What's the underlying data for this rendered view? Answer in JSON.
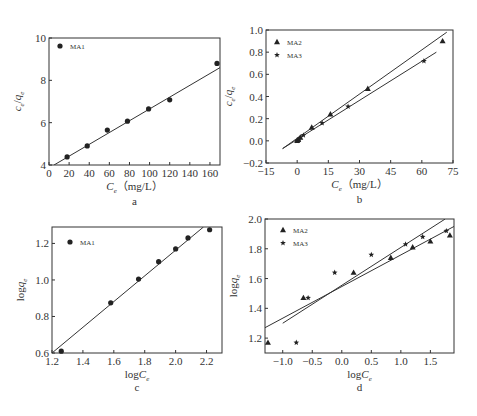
{
  "chart_data": [
    {
      "id": "a",
      "type": "scatter",
      "caption": "a",
      "xlabel": "Ce（mg/L）",
      "ylabel": "ce/qe",
      "xlim": [
        0,
        170
      ],
      "ylim": [
        4,
        10
      ],
      "xticks": [
        0,
        20,
        40,
        60,
        80,
        100,
        120,
        140,
        160
      ],
      "yticks": [
        4,
        6,
        8,
        10
      ],
      "grid": false,
      "legend_position": "upper-left",
      "series": [
        {
          "name": "MA1",
          "marker": "circle",
          "x": [
            18,
            38,
            58,
            78,
            99,
            120,
            167
          ],
          "y": [
            4.38,
            4.9,
            5.65,
            6.07,
            6.65,
            7.08,
            8.8
          ],
          "fit_line": {
            "x": [
              5,
              170
            ],
            "y": [
              4.0,
              8.6
            ]
          }
        }
      ]
    },
    {
      "id": "b",
      "type": "scatter",
      "caption": "b",
      "xlabel": "Ce（mg/L）",
      "ylabel": "ce/qe",
      "xlim": [
        -15,
        75
      ],
      "ylim": [
        -0.2,
        1.0
      ],
      "xticks": [
        -15,
        0,
        15,
        30,
        45,
        60,
        75
      ],
      "yticks": [
        -0.2,
        0.0,
        0.2,
        0.4,
        0.6,
        0.8,
        1.0
      ],
      "grid": false,
      "legend_position": "upper-left",
      "series": [
        {
          "name": "MA2",
          "marker": "triangle",
          "x": [
            0,
            0.5,
            1.5,
            7,
            16,
            34,
            70
          ],
          "y": [
            0.0,
            0.01,
            0.03,
            0.12,
            0.24,
            0.47,
            0.9
          ],
          "fit_line": {
            "x": [
              -7,
              72
            ],
            "y": [
              -0.07,
              0.98
            ]
          }
        },
        {
          "name": "MA3",
          "marker": "star",
          "x": [
            0,
            1,
            3,
            12,
            24.5,
            61
          ],
          "y": [
            0.0,
            0.02,
            0.05,
            0.16,
            0.31,
            0.72
          ],
          "fit_line": {
            "x": [
              -7,
              67
            ],
            "y": [
              -0.07,
              0.8
            ]
          }
        }
      ]
    },
    {
      "id": "c",
      "type": "scatter",
      "caption": "c",
      "xlabel": "logCe",
      "ylabel": "logqe",
      "xlim": [
        1.2,
        2.3
      ],
      "ylim": [
        0.6,
        1.29
      ],
      "xticks": [
        1.2,
        1.4,
        1.6,
        1.8,
        2.0,
        2.2
      ],
      "yticks": [
        0.6,
        0.8,
        1.0,
        1.2
      ],
      "grid": false,
      "legend_position": "upper-left",
      "series": [
        {
          "name": "MA1",
          "marker": "circle",
          "x": [
            1.26,
            1.58,
            1.76,
            1.89,
            2.0,
            2.08,
            2.22
          ],
          "y": [
            0.61,
            0.875,
            1.005,
            1.1,
            1.17,
            1.23,
            1.275
          ],
          "fit_line": {
            "x": [
              1.2,
              2.18
            ],
            "y": [
              0.6,
              1.29
            ]
          }
        }
      ]
    },
    {
      "id": "d",
      "type": "scatter",
      "caption": "d",
      "xlabel": "logCe",
      "ylabel": "logqe",
      "xlim": [
        -1.3,
        1.9
      ],
      "ylim": [
        1.1,
        2.0
      ],
      "xticks": [
        -1.0,
        -0.5,
        0.0,
        0.5,
        1.0,
        1.5
      ],
      "yticks": [
        1.2,
        1.4,
        1.6,
        1.8,
        2.0
      ],
      "grid": false,
      "legend_position": "upper-left",
      "series": [
        {
          "name": "MA2",
          "marker": "triangle",
          "x": [
            -1.25,
            -0.65,
            0.2,
            0.83,
            1.2,
            1.5,
            1.83
          ],
          "y": [
            1.17,
            1.47,
            1.64,
            1.74,
            1.81,
            1.85,
            1.89
          ],
          "fit_line": {
            "x": [
              -1.3,
              1.9
            ],
            "y": [
              1.27,
              1.95
            ]
          }
        },
        {
          "name": "MA3",
          "marker": "star",
          "x": [
            -0.77,
            -0.57,
            -0.12,
            0.5,
            1.08,
            1.37,
            1.77
          ],
          "y": [
            1.17,
            1.47,
            1.64,
            1.76,
            1.83,
            1.88,
            1.92
          ],
          "fit_line": {
            "x": [
              -1.0,
              1.75
            ],
            "y": [
              1.3,
              2.0
            ]
          }
        }
      ]
    }
  ]
}
